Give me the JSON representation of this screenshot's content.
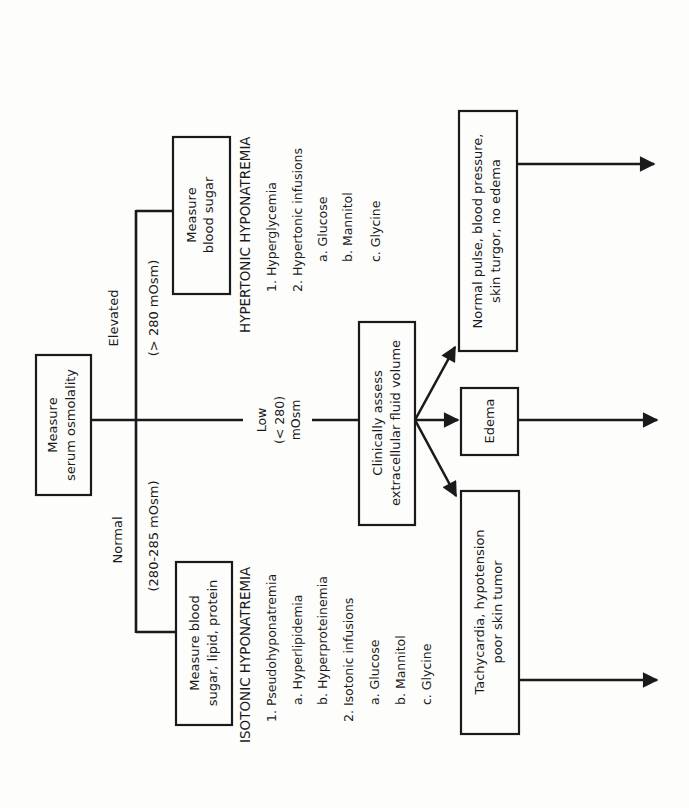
{
  "diagram": {
    "start_box": {
      "lines": [
        "Measure",
        "serum osmolality"
      ]
    },
    "branches": {
      "elevated": {
        "label": "Elevated",
        "range": "(> 280 mOsm)",
        "box": {
          "lines": [
            "Measure",
            "blood sugar"
          ]
        },
        "heading": "HYPERTONIC HYPONATREMIA",
        "items": [
          "1. Hyperglycemia",
          "2. Hypertonic infusions",
          "a. Glucose",
          "b. Mannitol",
          "c. Glycine"
        ]
      },
      "normal": {
        "label": "Normal",
        "range": "(280-285 mOsm)",
        "box": {
          "lines": [
            "Measure blood",
            "sugar, lipid, protein"
          ]
        },
        "heading": "ISOTONIC HYPONATREMIA",
        "items": [
          "1. Pseudohyponatremia",
          "a. Hyperlipidemia",
          "b. Hyperproteinemia",
          "2. Isotonic infusions",
          "a. Glucose",
          "b. Mannitol",
          "c. Glycine"
        ]
      },
      "low": {
        "label_lines": [
          "Low",
          "(< 280)",
          "mOsm"
        ],
        "box": {
          "lines": [
            "Clinically assess",
            "extracellular fluid volume"
          ]
        },
        "outcomes": [
          {
            "lines": [
              "Normal pulse, blood pressure,",
              "skin turgor, no edema"
            ]
          },
          {
            "lines": [
              "Edema"
            ]
          },
          {
            "lines": [
              "Tachycardia, hypotension",
              "poor skin tumor"
            ]
          }
        ]
      }
    }
  }
}
